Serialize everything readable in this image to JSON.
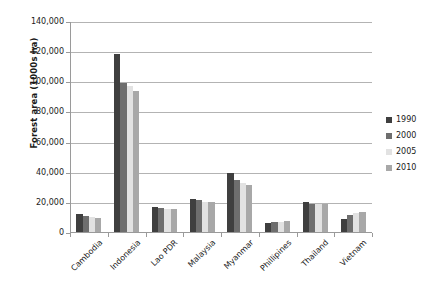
{
  "chart_data": {
    "type": "bar",
    "title": "",
    "xlabel": "",
    "ylabel": "Forest area (1000s ha)",
    "ylim": [
      0,
      140000
    ],
    "ytick_values": [
      0,
      20000,
      40000,
      60000,
      80000,
      100000,
      120000,
      140000
    ],
    "ytick_labels": [
      "0",
      "20,000",
      "40,000",
      "60,000",
      "80,000",
      "100,000",
      "120,000",
      "140,000"
    ],
    "grid": true,
    "grid_axis": "y",
    "legend_position": "right",
    "categories": [
      "Cambodia",
      "Indonesia",
      "Lao PDR",
      "Malaysia",
      "Myanmar",
      "Phillipines",
      "Thailand",
      "Vietnam"
    ],
    "series": [
      {
        "name": "1990",
        "color": "#3f3f3f",
        "values": [
          12946,
          118545,
          17314,
          22376,
          39588,
          6676,
          20445,
          9363
        ]
      },
      {
        "name": "2000",
        "color": "#6e6e6e",
        "values": [
          11541,
          99409,
          16532,
          21591,
          34868,
          7117,
          19004,
          11725
        ]
      },
      {
        "name": "2005",
        "color": "#e2e2e2",
        "values": [
          10731,
          97857,
          16142,
          20890,
          33321,
          7391,
          19004,
          13077
        ]
      },
      {
        "name": "2010",
        "color": "#a8a8a8",
        "values": [
          10094,
          94432,
          15751,
          20456,
          31773,
          7665,
          18972,
          13797
        ]
      }
    ]
  },
  "legend": {
    "items": [
      {
        "label": "1990",
        "swatch_name": "legend-swatch-1990"
      },
      {
        "label": "2000",
        "swatch_name": "legend-swatch-2000"
      },
      {
        "label": "2005",
        "swatch_name": "legend-swatch-2005"
      },
      {
        "label": "2010",
        "swatch_name": "legend-swatch-2010"
      }
    ]
  },
  "colors": {
    "axis": "#9a9a9a",
    "gridline": "#b3b3b3",
    "text": "#1a1a1a",
    "background": "#ffffff"
  }
}
